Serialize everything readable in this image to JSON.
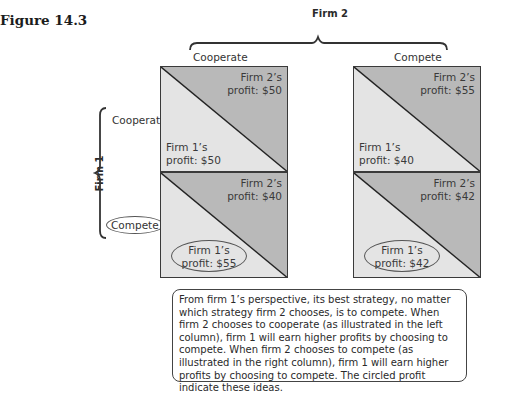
{
  "figure": {
    "title": "Figure 14.3"
  },
  "players": {
    "firm2": {
      "label": "Firm 2"
    },
    "firm1": {
      "label": "Firm 1"
    }
  },
  "strategies": {
    "columns": [
      "Cooperate",
      "Compete"
    ],
    "rows": [
      "Cooperate",
      "Compete"
    ],
    "circled_row": "Compete"
  },
  "payoff_matrix": {
    "cells": [
      {
        "row": "Cooperate",
        "col": "Cooperate",
        "firm2_line1": "Firm 2’s",
        "firm2_line2": "profit: $50",
        "firm1_line1": "Firm 1’s",
        "firm1_line2": "profit: $50",
        "firm1_circled": false
      },
      {
        "row": "Cooperate",
        "col": "Compete",
        "firm2_line1": "Firm 2’s",
        "firm2_line2": "profit: $55",
        "firm1_line1": "Firm 1’s",
        "firm1_line2": "profit: $40",
        "firm1_circled": false
      },
      {
        "row": "Compete",
        "col": "Cooperate",
        "firm2_line1": "Firm 2’s",
        "firm2_line2": "profit: $40",
        "firm1_line1": "Firm 1’s",
        "firm1_line2": "profit: $55",
        "firm1_circled": true
      },
      {
        "row": "Compete",
        "col": "Compete",
        "firm2_line1": "Firm 2’s",
        "firm2_line2": "profit: $42",
        "firm1_line1": "Firm 1’s",
        "firm1_line2": "profit: $42",
        "firm1_circled": true
      }
    ]
  },
  "note": {
    "text": "From firm 1’s perspective, its best strategy, no matter which strategy firm 2 chooses, is to compete. When firm 2 chooses to cooperate (as illustrated in the left column), firm 1 will earn higher profits by choosing to compete. When firm 2 chooses to compete (as illustrated in the right column), firm 1 will earn higher profits by choosing to compete. The circled profit indicate these ideas."
  },
  "colors": {
    "firm2_triangle": "#b9b9b9",
    "firm1_triangle": "#e4e4e4",
    "border": "#3a3a3a"
  }
}
